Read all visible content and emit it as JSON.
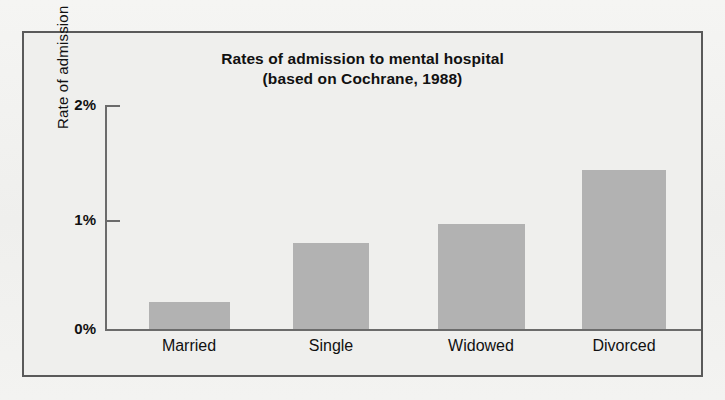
{
  "figure": {
    "title_line1": "Rates of admission to mental hospital",
    "title_line2": "(based on Cochrane, 1988)",
    "frame_color": "#5a5a5a",
    "background_color": "#efefed"
  },
  "chart_data": {
    "type": "bar",
    "title": "Rates of admission to mental hospital (based on Cochrane, 1988)",
    "subtitle": "(based on Cochrane, 1988)",
    "categories": [
      "Married",
      "Single",
      "Widowed",
      "Divorced"
    ],
    "values": [
      0.24,
      0.77,
      0.94,
      1.42
    ],
    "value_unit": "%",
    "xlabel": "",
    "ylabel": "Rate of admission",
    "ylim": [
      0,
      2
    ],
    "yticks": [
      0,
      1,
      2
    ],
    "ytick_labels": [
      "0%",
      "1%",
      "2%"
    ],
    "grid": false,
    "legend": false,
    "bar_color": "#b2b2b2",
    "axis_color": "#6b6b6b"
  }
}
